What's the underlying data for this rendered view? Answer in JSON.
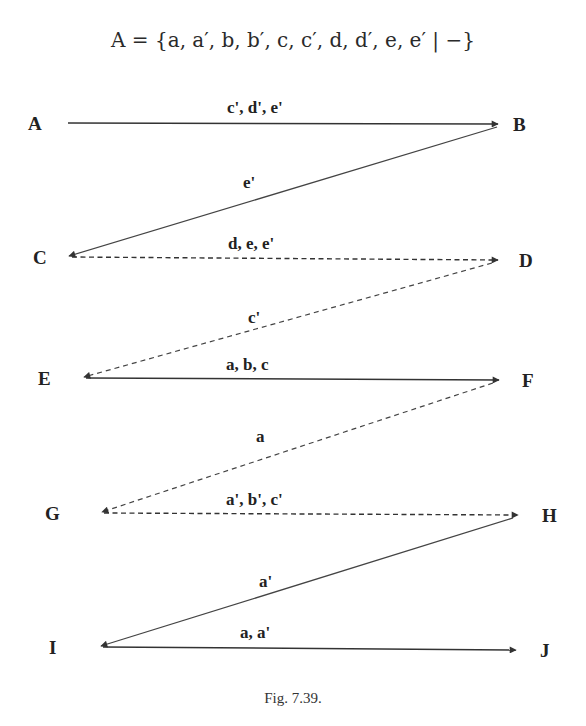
{
  "formula": {
    "lhs": "A",
    "text": "A = {a, a′, b, b′, c, c′, d, d′, e, e′ | −}"
  },
  "caption": "Fig. 7.39.",
  "nodes": [
    {
      "id": "A",
      "label": "A",
      "x": 37,
      "y": 123
    },
    {
      "id": "B",
      "label": "B",
      "x": 521,
      "y": 124
    },
    {
      "id": "C",
      "label": "C",
      "x": 42,
      "y": 257
    },
    {
      "id": "D",
      "label": "D",
      "x": 527,
      "y": 260
    },
    {
      "id": "E",
      "label": "E",
      "x": 45,
      "y": 378
    },
    {
      "id": "F",
      "label": "F",
      "x": 530,
      "y": 380
    },
    {
      "id": "G",
      "label": "G",
      "x": 55,
      "y": 513
    },
    {
      "id": "H",
      "label": "H",
      "x": 551,
      "y": 515
    },
    {
      "id": "I",
      "label": "I",
      "x": 55,
      "y": 647
    },
    {
      "id": "J",
      "label": "J",
      "x": 547,
      "y": 650
    }
  ],
  "edges": [
    {
      "from": "A",
      "to": "B",
      "label": "c', d', e'",
      "style": "solid"
    },
    {
      "from": "B",
      "to": "C",
      "label": "e'",
      "style": "solid"
    },
    {
      "from": "C",
      "to": "D",
      "label": "d, e, e'",
      "style": "dashed"
    },
    {
      "from": "D",
      "to": "E",
      "label": "c'",
      "style": "dashed"
    },
    {
      "from": "E",
      "to": "F",
      "label": "a, b, c",
      "style": "solid"
    },
    {
      "from": "F",
      "to": "G",
      "label": "a",
      "style": "dashed"
    },
    {
      "from": "G",
      "to": "H",
      "label": "a', b', c'",
      "style": "dashed"
    },
    {
      "from": "H",
      "to": "I",
      "label": "a'",
      "style": "solid"
    },
    {
      "from": "I",
      "to": "J",
      "label": "a, a'",
      "style": "solid"
    }
  ],
  "colors": {
    "line": "#333333",
    "text": "#222222",
    "background": "#ffffff"
  }
}
